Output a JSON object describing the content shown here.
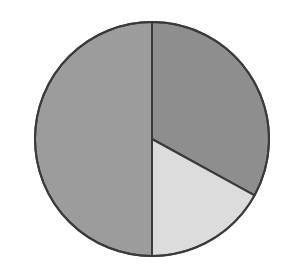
{
  "chart_data": {
    "type": "pie",
    "title": "",
    "labels": [
      "Slice A",
      "Slice B",
      "Slice C"
    ],
    "values": [
      33,
      17,
      50
    ],
    "colors": [
      "#8e8e8e",
      "#dcdcdc",
      "#9c9c9c"
    ],
    "start_angle_deg": 0,
    "direction": "clockwise",
    "legend": "none",
    "border_color": "#3a3a3a"
  },
  "layout": {
    "cx": 152,
    "cy": 139,
    "r": 117
  }
}
